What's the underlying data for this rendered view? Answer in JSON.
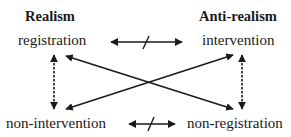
{
  "diagram": {
    "columns": [
      {
        "heading": "Realism",
        "top": "registration",
        "bottom": "non-intervention"
      },
      {
        "heading": "Anti-realism",
        "top": "intervention",
        "bottom": "non-registration"
      }
    ],
    "relations": [
      {
        "from": "registration",
        "to": "intervention",
        "type": "negated-bidirectional",
        "style": "solid"
      },
      {
        "from": "non-intervention",
        "to": "non-registration",
        "type": "negated-bidirectional",
        "style": "solid"
      },
      {
        "from": "registration",
        "to": "non-intervention",
        "type": "bidirectional",
        "style": "dashed"
      },
      {
        "from": "intervention",
        "to": "non-registration",
        "type": "bidirectional",
        "style": "dashed"
      },
      {
        "from": "registration",
        "to": "non-registration",
        "type": "bidirectional",
        "style": "solid-diagonal"
      },
      {
        "from": "intervention",
        "to": "non-intervention",
        "type": "bidirectional",
        "style": "solid-diagonal"
      }
    ],
    "colors": {
      "ink": "#1a1a1a",
      "background": "#ffffff"
    }
  }
}
